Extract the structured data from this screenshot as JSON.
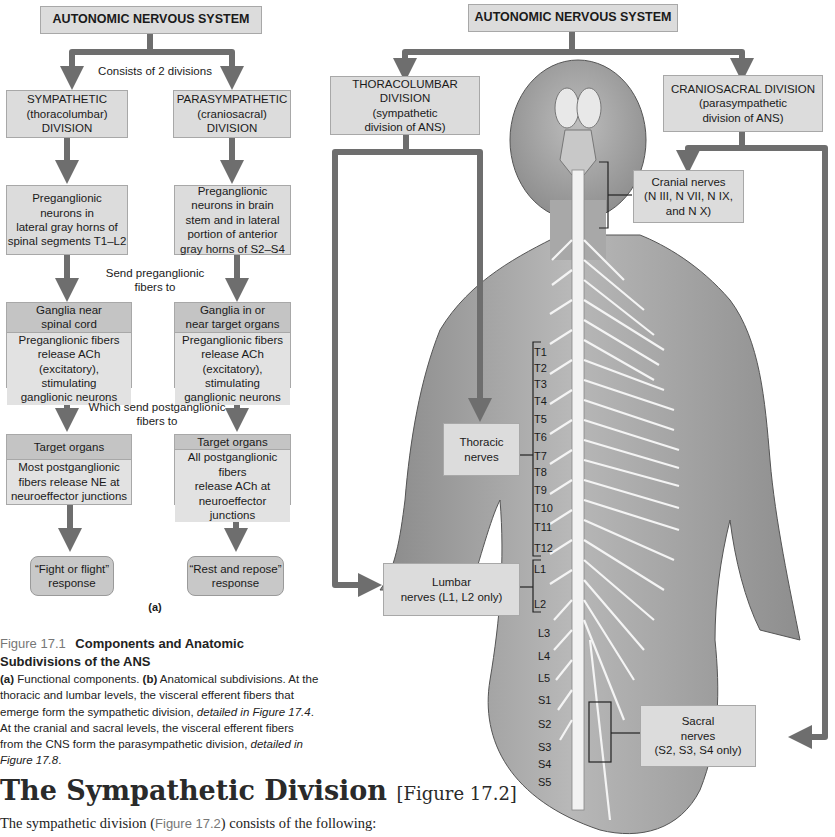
{
  "panel_a": {
    "root": "AUTONOMIC NERVOUS SYSTEM",
    "consists_label": "Consists of 2 divisions",
    "sympathetic": {
      "division": [
        "SYMPATHETIC",
        "(thoracolumbar)",
        "DIVISION"
      ],
      "preganglionic": [
        "Preganglionic",
        "neurons in",
        "lateral gray horns of",
        "spinal segments T1–L2"
      ],
      "ganglia_title": [
        "Ganglia near",
        "spinal cord"
      ],
      "ganglia_body": [
        "Preganglionic fibers",
        "release ACh (excitatory),",
        "stimulating",
        "ganglionic neurons"
      ],
      "target_title": "Target organs",
      "target_body": [
        "Most postganglionic",
        "fibers release NE at",
        "neuroeffector junctions"
      ],
      "response": [
        "“Fight or flight”",
        "response"
      ]
    },
    "parasympathetic": {
      "division": [
        "PARASYMPATHETIC",
        "(craniosacral)",
        "DIVISION"
      ],
      "preganglionic": [
        "Preganglionic",
        "neurons in brain",
        "stem and in lateral",
        "portion of anterior",
        "gray horns of S2–S4"
      ],
      "ganglia_title": [
        "Ganglia in or",
        "near target organs"
      ],
      "ganglia_body": [
        "Preganglionic fibers",
        "release ACh (excitatory),",
        "stimulating",
        "ganglionic neurons"
      ],
      "target_title": "Target organs",
      "target_body": [
        "All postganglionic fibers",
        "release ACh at",
        "neuroeffector junctions"
      ],
      "response": [
        "“Rest and repose”",
        "response"
      ]
    },
    "send_pre_label": [
      "Send preganglionic",
      "fibers to"
    ],
    "send_post_label": [
      "Which send postganglionic",
      "fibers to"
    ],
    "panel_label": "(a)"
  },
  "panel_b": {
    "root": "AUTONOMIC NERVOUS SYSTEM",
    "thoracolumbar": [
      "THORACOLUMBAR DIVISION",
      "(sympathetic",
      "division of ANS)"
    ],
    "craniosacral": [
      "CRANIOSACRAL DIVISION",
      "(parasympathetic",
      "division of ANS)"
    ],
    "cranial_nerves": [
      "Cranial nerves",
      "(N III, N VII, N IX,",
      "and N X)"
    ],
    "thoracic_nerves": [
      "Thoracic",
      "nerves"
    ],
    "lumbar_nerves": [
      "Lumbar",
      "nerves (L1, L2 only)"
    ],
    "sacral_nerves": [
      "Sacral",
      "nerves",
      "(S2, S3, S4 only)"
    ],
    "segments": {
      "thoracic": [
        "T1",
        "T2",
        "T3",
        "T4",
        "T5",
        "T6",
        "T7",
        "T8",
        "T9",
        "T10",
        "T11",
        "T12"
      ],
      "lumbar": [
        "L1",
        "L2",
        "L3",
        "L4",
        "L5"
      ],
      "sacral": [
        "S1",
        "S2",
        "S3",
        "S4",
        "S5"
      ]
    }
  },
  "caption": {
    "label": "Figure 17.1",
    "title": "Components and Anatomic Subdivisions of the ANS",
    "a_tag": "(a)",
    "a_text": " Functional components. ",
    "b_tag": "(b)",
    "b_text": " Anatomical subdivisions. At the thoracic and lumbar levels, the visceral efferent fibers that emerge form the sympathetic division, ",
    "ref1": "detailed in Figure 17.4",
    "mid": ". At the cranial and sacral levels, the visceral efferent fibers from the CNS form the parasympathetic division, ",
    "ref2": "detailed in Figure 17.8",
    "end": "."
  },
  "section": {
    "heading": "The Sympathetic Division",
    "heading_ref": "[Figure 17.2]",
    "para_start": "The sympathetic division (",
    "para_fig": "Figure 17.2",
    "para_end": ") consists of the following:"
  },
  "colors": {
    "arrow": "#6e6e6e",
    "box": "#dcdcdc",
    "box_dark": "#c4c4c4",
    "caption_label": "#777777"
  }
}
